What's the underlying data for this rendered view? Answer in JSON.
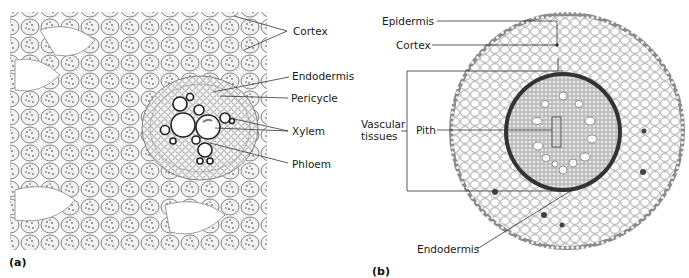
{
  "figure": {
    "panel_a": {
      "tag": "(a)",
      "labels": {
        "cortex": "Cortex",
        "endodermis": "Endodermis",
        "pericycle": "Pericycle",
        "xylem": "Xylem",
        "phloem": "Phloem"
      }
    },
    "panel_b": {
      "tag": "(b)",
      "labels": {
        "epidermis": "Epidermis",
        "cortex": "Cortex",
        "vascular_tissues_line1": "Vascular",
        "vascular_tissues_line2": "tissues",
        "pith": "Pith",
        "endodermis": "Endodermis"
      }
    }
  },
  "colors": {
    "cell_wall": "#555555",
    "cell_fill": "#f4f4f4",
    "stele_ring": "#3a3a3a",
    "label_text": "#1a1a1a",
    "leader_line": "#333333"
  }
}
